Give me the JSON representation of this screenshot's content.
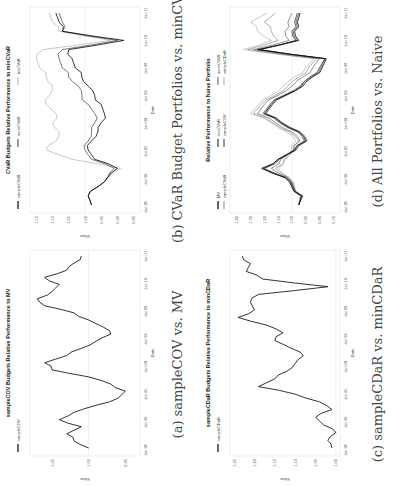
{
  "figure": {
    "panels": [
      {
        "id": "a",
        "caption": "(a) sampleCOV vs. MV",
        "title": "sampleCOV Budgets Relative Performance to MV",
        "xlabel": "Date",
        "ylabel": "Value"
      },
      {
        "id": "b",
        "caption": "(b) CVaR Budget Portfolios vs. minCVaR",
        "title": "CVaR Budgets Relative Performance to minCVaR",
        "xlabel": "Date",
        "ylabel": "Value"
      },
      {
        "id": "c",
        "caption": "(c) sampleCDaR vs. minCDaR",
        "title": "sampleCDaR Budgets Relative Performance to minCDaR",
        "xlabel": "Date",
        "ylabel": "Value"
      },
      {
        "id": "d",
        "caption": "(d) All Portfolios vs. Naive",
        "title": "Relative Performance to Naive Portfolio",
        "xlabel": "Date",
        "ylabel": "Value"
      }
    ]
  },
  "chart_data": [
    {
      "type": "line",
      "title": "sampleCOV Budgets Relative Performance to MV",
      "xlabel": "Date",
      "ylabel": "Value",
      "x": [
        "Jan 98",
        "Jan 00",
        "Jan 02",
        "Jan 04",
        "Jan 06",
        "Jan 08",
        "Jan 10",
        "Jan 11"
      ],
      "yticks": [
        1.05,
        1.0,
        0.95
      ],
      "ylim": [
        0.93,
        1.08
      ],
      "grid": false,
      "legend": {
        "position": "top-left",
        "entries": [
          "sampleCOV"
        ]
      },
      "series": [
        {
          "name": "sampleCOV",
          "color": "#000000",
          "values": [
            1.0,
            1.02,
            1.03,
            1.01,
            1.04,
            1.02,
            0.99,
            0.96,
            0.95,
            0.97,
            1.0,
            1.05,
            1.06,
            1.03,
            1.01,
            0.99,
            0.97,
            0.98,
            1.0,
            1.02,
            1.06,
            1.07,
            1.05,
            1.04,
            1.06,
            1.03,
            1.02,
            1.01
          ]
        }
      ]
    },
    {
      "type": "line",
      "title": "CVaR Budgets Relative Performance to minCVaR",
      "xlabel": "Date",
      "ylabel": "Value",
      "x": [
        "Jan 98",
        "Jan 00",
        "Jan 02",
        "Jan 04",
        "Jan 06",
        "Jan 08",
        "Jan 10",
        "Jan 11"
      ],
      "yticks": [
        1.15,
        1.1,
        1.05,
        1.0,
        0.95,
        0.9,
        0.85
      ],
      "ylim": [
        0.83,
        1.17
      ],
      "grid": false,
      "legend": {
        "position": "top",
        "entries": [
          "sampleCVaR",
          "normCVaR",
          "tesCVaR"
        ]
      },
      "series": [
        {
          "name": "sampleCVaR",
          "color": "#000000",
          "values": [
            0.98,
            0.99,
            0.96,
            0.93,
            0.9,
            0.97,
            0.99,
            0.98,
            0.96,
            0.95,
            0.94,
            0.95,
            0.97,
            0.99,
            1.01,
            1.03,
            1.04,
            1.05,
            0.88,
            1.07,
            1.08,
            1.09
          ]
        },
        {
          "name": "normCVaR",
          "color": "#555555",
          "values": [
            0.98,
            0.99,
            0.96,
            0.93,
            0.91,
            0.98,
            1.0,
            0.99,
            0.98,
            0.97,
            0.97,
            0.99,
            1.01,
            1.02,
            1.05,
            1.07,
            1.08,
            1.07,
            0.9,
            1.07,
            1.07,
            1.08
          ]
        },
        {
          "name": "tesCVaR",
          "color": "#bbbbbb",
          "values": [
            0.98,
            0.99,
            0.96,
            0.93,
            0.89,
            1.04,
            1.12,
            1.09,
            1.08,
            1.1,
            1.09,
            1.12,
            1.11,
            1.1,
            1.12,
            1.14,
            1.15,
            1.13,
            0.92,
            1.08,
            1.1,
            1.11
          ]
        }
      ]
    },
    {
      "type": "line",
      "title": "sampleCDaR Budgets Relative Performance to minCDaR",
      "xlabel": "Date",
      "ylabel": "Value",
      "x": [
        "Jan 98",
        "Jan 00",
        "Jan 02",
        "Jan 04",
        "Jan 06",
        "Jan 08",
        "Jan 10",
        "Jan 11"
      ],
      "yticks": [
        1.25,
        1.2,
        1.15,
        1.1,
        1.05,
        1.0
      ],
      "ylim": [
        0.99,
        1.26
      ],
      "grid": false,
      "legend": {
        "position": "top-left",
        "entries": [
          "sampleCDaR"
        ]
      },
      "series": [
        {
          "name": "sampleCDaR",
          "color": "#000000",
          "values": [
            1.01,
            1.02,
            1.0,
            1.03,
            1.05,
            1.01,
            1.04,
            1.1,
            1.19,
            1.15,
            1.12,
            1.1,
            1.08,
            1.11,
            1.15,
            1.13,
            1.17,
            1.24,
            1.2,
            1.21,
            1.19,
            1.02,
            1.18,
            1.22,
            1.21,
            1.23
          ]
        }
      ]
    },
    {
      "type": "line",
      "title": "Relative Performance to Naive Portfolio",
      "xlabel": "Date",
      "ylabel": "Value",
      "x": [
        "Jan 98",
        "Jan 00",
        "Jan 02",
        "Jan 04",
        "Jan 06",
        "Jan 08",
        "Jan 10",
        "Jan 11"
      ],
      "yticks": [
        1.4,
        1.3,
        1.2,
        1.1,
        1.0,
        0.9,
        0.8,
        0.7
      ],
      "ylim": [
        0.65,
        1.45
      ],
      "grid": false,
      "legend": {
        "position": "top",
        "entries": [
          "MV",
          "minCVaR",
          "normCVaR",
          "sampleCVaR",
          "sampleCOV",
          "sampleCDaR"
        ]
      },
      "series": [
        {
          "name": "MV",
          "color": "#000000",
          "values": [
            0.95,
            0.93,
            1.0,
            1.05,
            1.22,
            1.1,
            0.98,
            0.9,
            0.95,
            1.08,
            1.2,
            1.15,
            1.05,
            0.92,
            0.85,
            0.78,
            0.75,
            1.25,
            0.95,
            0.98,
            0.96,
            0.94
          ]
        },
        {
          "name": "minCVaR",
          "color": "#333333",
          "values": [
            0.95,
            0.92,
            0.99,
            1.04,
            1.2,
            1.09,
            0.97,
            0.89,
            0.94,
            1.07,
            1.19,
            1.14,
            1.04,
            0.93,
            0.87,
            0.8,
            0.76,
            1.23,
            0.97,
            1.0,
            0.98,
            0.96
          ]
        },
        {
          "name": "normCVaR",
          "color": "#777777",
          "values": [
            0.95,
            0.93,
            0.99,
            1.03,
            1.15,
            1.08,
            0.99,
            0.94,
            1.0,
            1.12,
            1.25,
            1.2,
            1.1,
            1.0,
            0.92,
            0.85,
            0.8,
            1.28,
            1.02,
            1.05,
            1.03,
            1.0
          ]
        },
        {
          "name": "sampleCVaR",
          "color": "#999999",
          "values": [
            0.95,
            0.93,
            0.98,
            1.02,
            1.12,
            1.05,
            0.98,
            0.95,
            1.02,
            1.14,
            1.28,
            1.22,
            1.12,
            1.03,
            0.95,
            0.88,
            0.82,
            1.32,
            1.1,
            1.15,
            1.2,
            1.12
          ]
        },
        {
          "name": "sampleCOV",
          "color": "#555555",
          "values": [
            0.95,
            0.93,
            1.0,
            1.05,
            1.21,
            1.1,
            0.98,
            0.91,
            0.96,
            1.09,
            1.21,
            1.16,
            1.06,
            0.94,
            0.86,
            0.79,
            0.76,
            1.24,
            0.96,
            0.99,
            0.97,
            0.95
          ]
        },
        {
          "name": "sampleCDaR",
          "color": "#bbbbbb",
          "values": [
            0.95,
            0.94,
            0.99,
            1.02,
            1.1,
            1.06,
            1.0,
            0.97,
            1.04,
            1.15,
            1.3,
            1.24,
            1.15,
            1.06,
            0.98,
            0.9,
            0.84,
            1.35,
            1.15,
            1.25,
            1.3,
            1.18
          ]
        }
      ]
    }
  ]
}
